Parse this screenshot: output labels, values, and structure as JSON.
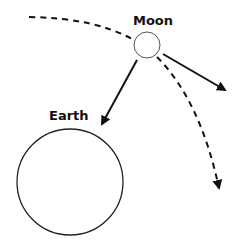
{
  "diagram": {
    "labels": {
      "moon": "Moon",
      "earth": "Earth"
    },
    "colors": {
      "stroke": "#111111",
      "background": "#ffffff"
    }
  }
}
